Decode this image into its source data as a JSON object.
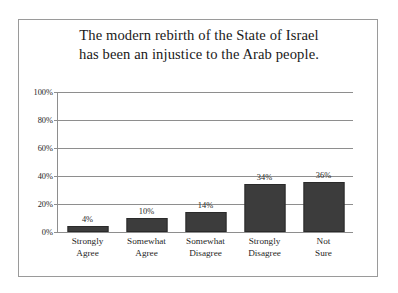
{
  "chart_data": {
    "type": "bar",
    "title": "The modern rebirth of the State of Israel has been an injustice to the Arab people.",
    "title_lines": [
      "The modern rebirth of the State of Israel",
      "has been an injustice to the Arab people."
    ],
    "categories": [
      "Strongly Agree",
      "Somewhat Agree",
      "Somewhat Disagree",
      "Strongly Disagree",
      "Not Sure"
    ],
    "category_lines": [
      [
        "Strongly",
        "Agree"
      ],
      [
        "Somewhat",
        "Agree"
      ],
      [
        "Somewhat",
        "Disagree"
      ],
      [
        "Strongly",
        "Disagree"
      ],
      [
        "Not",
        "Sure"
      ]
    ],
    "values": [
      4,
      10,
      14,
      34,
      36
    ],
    "value_labels": [
      "4%",
      "10%",
      "14%",
      "34%",
      "36%"
    ],
    "xlabel": "",
    "ylabel": "",
    "ylim": [
      0,
      100
    ],
    "ytick_values": [
      0,
      20,
      40,
      60,
      80,
      100
    ],
    "ytick_labels": [
      "0%",
      "20%",
      "40%",
      "60%",
      "80%",
      "100%"
    ],
    "grid": true,
    "legend": false,
    "legend_position": "none",
    "bar_color": "#3c3c3c",
    "bar_edge_color": "#2a2a2a",
    "axis_color": "#8e8e8e",
    "background_color": "#ffffff",
    "frame_border_color": "#9a9a9a",
    "text_color": "#1c1c1c"
  }
}
